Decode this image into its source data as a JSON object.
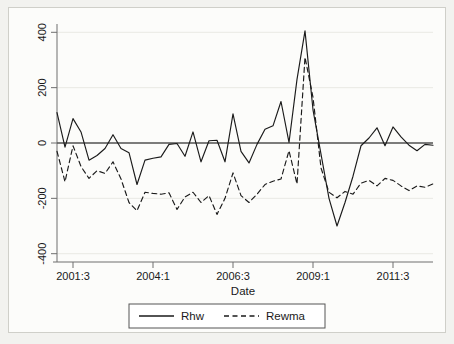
{
  "chart_data": {
    "type": "line",
    "title": "",
    "xlabel": "Date",
    "ylabel": "",
    "xlim": [
      0,
      47
    ],
    "ylim": [
      -430,
      430
    ],
    "yticks": [
      400,
      200,
      0,
      -200,
      -400
    ],
    "ytick_labels": [
      "400",
      "200",
      "0",
      "-200",
      "-400"
    ],
    "xticks": [
      2,
      12,
      22,
      32,
      42
    ],
    "xtick_labels": [
      "2001:3",
      "2004:1",
      "2006:3",
      "2009:1",
      "2011:3"
    ],
    "grid": "horizontal",
    "zero_line": true,
    "legend_position": "bottom",
    "x": [
      0,
      1,
      2,
      3,
      4,
      5,
      6,
      7,
      8,
      9,
      10,
      11,
      12,
      13,
      14,
      15,
      16,
      17,
      18,
      19,
      20,
      21,
      22,
      23,
      24,
      25,
      26,
      27,
      28,
      29,
      30,
      31,
      32,
      33,
      34,
      35,
      36,
      37,
      38,
      39,
      40,
      41,
      42,
      43,
      44,
      45,
      46,
      47
    ],
    "x_periods": [
      "2001:1",
      "2001:2",
      "2001:3",
      "2001:4",
      "2002:1",
      "2002:2",
      "2002:3",
      "2002:4",
      "2003:1",
      "2003:2",
      "2003:3",
      "2003:4",
      "2004:1",
      "2004:2",
      "2004:3",
      "2004:4",
      "2005:1",
      "2005:2",
      "2005:3",
      "2005:4",
      "2006:1",
      "2006:2",
      "2006:3",
      "2006:4",
      "2007:1",
      "2007:2",
      "2007:3",
      "2007:4",
      "2008:1",
      "2008:2",
      "2008:3",
      "2008:4",
      "2009:1",
      "2009:2",
      "2009:3",
      "2009:4",
      "2010:1",
      "2010:2",
      "2010:3",
      "2010:4",
      "2011:1",
      "2011:2",
      "2011:3",
      "2011:4",
      "2012:1",
      "2012:2",
      "2012:3",
      "2012:4"
    ],
    "series": [
      {
        "name": "Rhw",
        "style": "solid",
        "color": "#1a1a1a",
        "values": [
          110,
          -15,
          88,
          40,
          -62,
          -45,
          -20,
          30,
          -20,
          -35,
          -150,
          -62,
          -55,
          -50,
          -5,
          -2,
          -48,
          40,
          -68,
          8,
          10,
          -68,
          105,
          -30,
          -72,
          -5,
          50,
          62,
          150,
          2,
          230,
          405,
          120,
          -40,
          -200,
          -300,
          -215,
          -120,
          -10,
          18,
          55,
          -10,
          58,
          22,
          -8,
          -28,
          -5,
          -8
        ]
      },
      {
        "name": "Rewma",
        "style": "dashed",
        "color": "#1a1a1a",
        "values": [
          -30,
          -140,
          -10,
          -85,
          -128,
          -100,
          -110,
          -68,
          -130,
          -215,
          -245,
          -178,
          -182,
          -185,
          -180,
          -240,
          -195,
          -178,
          -215,
          -190,
          -258,
          -200,
          -108,
          -190,
          -215,
          -185,
          -150,
          -138,
          -130,
          -28,
          -148,
          310,
          165,
          -90,
          -178,
          -198,
          -175,
          -185,
          -145,
          -135,
          -155,
          -128,
          -135,
          -155,
          -172,
          -155,
          -160,
          -148
        ]
      }
    ]
  },
  "legend": {
    "entries": [
      {
        "label": "Rhw",
        "style": "solid"
      },
      {
        "label": "Rewma",
        "style": "dashed"
      }
    ]
  }
}
